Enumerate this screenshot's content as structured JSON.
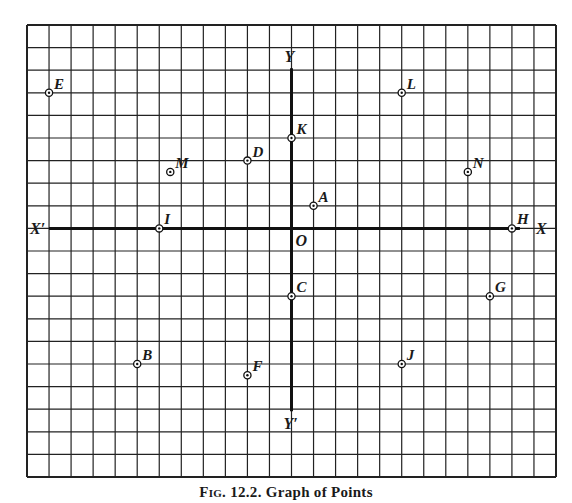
{
  "caption": {
    "prefix": "Fig. 12.2.",
    "title": "Graph of Points"
  },
  "grid": {
    "columns": 24,
    "rows": 20,
    "origin_col": 12,
    "origin_row": 9,
    "line_color": "#222222",
    "axis_color": "#111111"
  },
  "axes": {
    "x_positive": "X",
    "x_negative": "X′",
    "y_positive": "Y",
    "y_negative": "Y′",
    "origin": "O"
  },
  "points": [
    {
      "label": "A",
      "x": 1,
      "y": 1
    },
    {
      "label": "B",
      "x": -7,
      "y": -6
    },
    {
      "label": "C",
      "x": 0,
      "y": -3
    },
    {
      "label": "D",
      "x": -2,
      "y": 3
    },
    {
      "label": "E",
      "x": -11,
      "y": 6
    },
    {
      "label": "F",
      "x": -2,
      "y": -6.5
    },
    {
      "label": "G",
      "x": 9,
      "y": -3
    },
    {
      "label": "H",
      "x": 10,
      "y": 0
    },
    {
      "label": "I",
      "x": -6,
      "y": 0
    },
    {
      "label": "J",
      "x": 5,
      "y": -6
    },
    {
      "label": "K",
      "x": 0,
      "y": 4
    },
    {
      "label": "L",
      "x": 5,
      "y": 6
    },
    {
      "label": "M",
      "x": -5.5,
      "y": 2.5
    },
    {
      "label": "N",
      "x": 8,
      "y": 2.5
    }
  ]
}
